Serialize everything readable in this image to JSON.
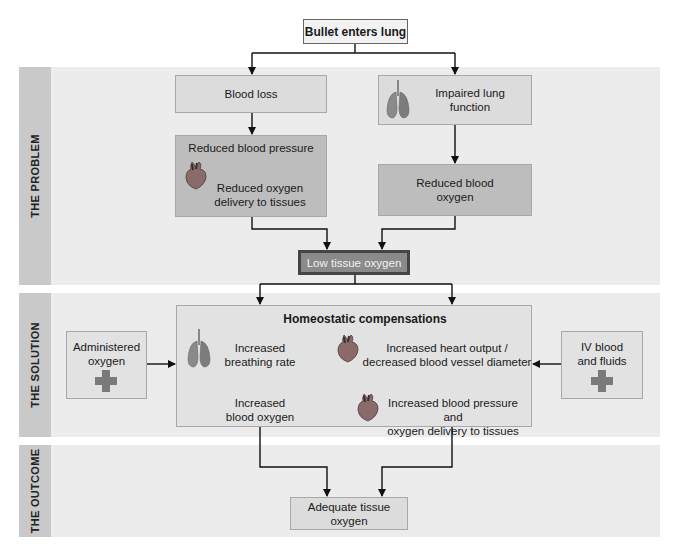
{
  "diagram": {
    "top_event": "Bullet enters lung",
    "sections": {
      "problem": {
        "label": "THE PROBLEM",
        "blood_loss": "Blood loss",
        "reduced_bp": "Reduced blood pressure",
        "reduced_o2_delivery_line1": "Reduced oxygen",
        "reduced_o2_delivery_line2": "delivery to tissues",
        "impaired_lung_line1": "Impaired lung",
        "impaired_lung_line2": "function",
        "reduced_blood_o2_line1": "Reduced blood",
        "reduced_blood_o2_line2": "oxygen",
        "low_tissue_oxygen": "Low tissue oxygen"
      },
      "solution": {
        "label": "THE SOLUTION",
        "administered_oxygen_line1": "Administered",
        "administered_oxygen_line2": "oxygen",
        "homeostatic_title": "Homeostatic compensations",
        "increased_breathing_line1": "Increased",
        "increased_breathing_line2": "breathing rate",
        "increased_blood_o2_line1": "Increased",
        "increased_blood_o2_line2": "blood oxygen",
        "heart_output_line1": "Increased heart output /",
        "heart_output_line2": "decreased blood vessel diameter",
        "increased_bp_line1": "Increased blood pressure and",
        "increased_bp_line2": "oxygen delivery to tissues",
        "iv_line1": "IV blood",
        "iv_line2": "and fluids"
      },
      "outcome": {
        "label": "THE OUTCOME",
        "adequate": "Adequate tissue oxygen"
      }
    },
    "icons": [
      "heart-icon",
      "lungs-icon",
      "medical-cross-icon"
    ],
    "colors": {
      "band": "#ececec",
      "band_label": "#c9c9c9",
      "box_light": "#dcdcdc",
      "box_mid": "#bdbdbd",
      "box_dark": "#8a8a8a",
      "box_dark_border": "#454545",
      "cross": "#7a7a7a"
    }
  }
}
